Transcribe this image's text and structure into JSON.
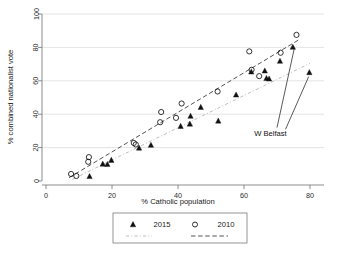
{
  "chart_data": {
    "type": "scatter",
    "title": "",
    "xlabel": "% Catholic population",
    "ylabel": "% combined nationalist vote",
    "xlim": [
      0,
      80
    ],
    "ylim": [
      0,
      100
    ],
    "xticks": [
      0,
      20,
      40,
      60,
      80
    ],
    "yticks": [
      0,
      20,
      40,
      60,
      80,
      100
    ],
    "xtick_labels": [
      "0",
      "20",
      "40",
      "60",
      "80"
    ],
    "ytick_labels": [
      "0",
      "20",
      "40",
      "60",
      "80",
      "100"
    ],
    "grid": "horizontal",
    "legend_position": "below-plot",
    "series": [
      {
        "name": "2015",
        "marker": "filled-triangle",
        "color": "#111111",
        "points": [
          [
            13.2,
            2.8
          ],
          [
            17.2,
            10.2
          ],
          [
            18.6,
            10.0
          ],
          [
            19.8,
            12.5
          ],
          [
            28.2,
            19.8
          ],
          [
            31.8,
            21.5
          ],
          [
            40.8,
            32.8
          ],
          [
            43.6,
            34.2
          ],
          [
            43.8,
            38.9
          ],
          [
            46.9,
            44.2
          ],
          [
            52.2,
            36.0
          ],
          [
            57.6,
            51.6
          ],
          [
            62.2,
            65.4
          ],
          [
            66.3,
            66.0
          ],
          [
            66.8,
            61.5
          ],
          [
            67.6,
            61.2
          ],
          [
            70.9,
            71.8
          ],
          [
            74.8,
            80.2
          ],
          [
            79.8,
            65.0
          ]
        ]
      },
      {
        "name": "2010",
        "marker": "open-circle",
        "color": "#111111",
        "points": [
          [
            7.6,
            4.2
          ],
          [
            9.2,
            3.0
          ],
          [
            12.8,
            11.5
          ],
          [
            13.0,
            14.3
          ],
          [
            26.6,
            22.8
          ],
          [
            27.2,
            21.9
          ],
          [
            34.6,
            35.2
          ],
          [
            34.9,
            41.3
          ],
          [
            39.4,
            37.8
          ],
          [
            41.1,
            46.4
          ],
          [
            52.0,
            53.6
          ],
          [
            61.6,
            77.6
          ],
          [
            62.3,
            66.6
          ],
          [
            64.6,
            62.8
          ],
          [
            71.1,
            76.8
          ],
          [
            75.9,
            87.5
          ]
        ]
      }
    ],
    "fit_lines": [
      {
        "name": "2015-fit",
        "style": "dash-dot",
        "color": "#b4b4b4",
        "x0": 8.0,
        "y0": 1.0,
        "x1": 80.0,
        "y1": 70.5
      },
      {
        "name": "2010-fit",
        "style": "dashed",
        "color": "#4a4a4a",
        "x0": 7.0,
        "y0": 2.0,
        "x1": 77.0,
        "y1": 85.0
      }
    ],
    "annotations": [
      {
        "label": "W Belfast",
        "text_x": 68.0,
        "text_y": 27.0,
        "leaders": [
          {
            "from_x": 70.0,
            "from_y": 32.0,
            "to_x": 75.2,
            "to_y": 79.0
          },
          {
            "from_x": 72.6,
            "from_y": 31.0,
            "to_x": 79.6,
            "to_y": 62.5
          }
        ]
      }
    ]
  },
  "legend": {
    "items": [
      {
        "label": "2015",
        "marker": "filled-triangle"
      },
      {
        "label": "2010",
        "marker": "open-circle"
      }
    ],
    "line_items": [
      {
        "label": "",
        "style": "dash-dot"
      },
      {
        "label": "",
        "style": "dashed"
      }
    ]
  }
}
